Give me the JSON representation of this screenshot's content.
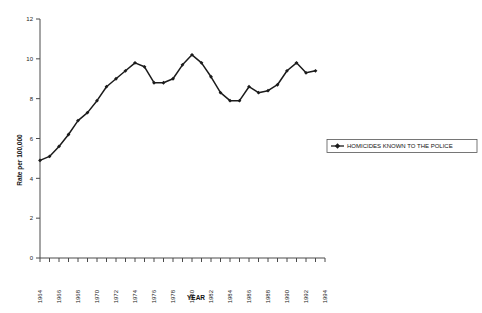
{
  "chart_data": {
    "type": "line",
    "title": "",
    "xlabel": "YEAR",
    "ylabel": "Rate per 100,000",
    "ylim": [
      0,
      12
    ],
    "xlim": [
      1964,
      1994
    ],
    "ytick_labels": [
      "0",
      "2",
      "4",
      "6",
      "8",
      "10",
      "12"
    ],
    "ytick_values": [
      0,
      2,
      4,
      6,
      8,
      10,
      12
    ],
    "xtick_labels": [
      "1964",
      "1966",
      "1968",
      "1970",
      "1972",
      "1974",
      "1976",
      "1978",
      "1980",
      "1982",
      "1984",
      "1986",
      "1988",
      "1990",
      "1992",
      "1994"
    ],
    "xtick_values": [
      1964,
      1966,
      1968,
      1970,
      1972,
      1974,
      1976,
      1978,
      1980,
      1982,
      1984,
      1986,
      1988,
      1990,
      1992,
      1994
    ],
    "minor_tick_interval": 1,
    "grid": false,
    "legend_position": "right",
    "marker": "filled-diamond",
    "line_color": "#1b1b1b",
    "x": [
      1964,
      1965,
      1966,
      1967,
      1968,
      1969,
      1970,
      1971,
      1972,
      1973,
      1974,
      1975,
      1976,
      1977,
      1978,
      1979,
      1980,
      1981,
      1982,
      1983,
      1984,
      1985,
      1986,
      1987,
      1988,
      1989,
      1990,
      1991,
      1992,
      1993
    ],
    "series": [
      {
        "name": "HOMICIDES KNOWN TO THE POLICE",
        "values": [
          4.9,
          5.1,
          5.6,
          6.2,
          6.9,
          7.3,
          7.9,
          8.6,
          9.0,
          9.4,
          9.8,
          9.6,
          8.8,
          8.8,
          9.0,
          9.7,
          10.2,
          9.8,
          9.1,
          8.3,
          7.9,
          7.9,
          8.6,
          8.3,
          8.4,
          8.7,
          9.4,
          9.8,
          9.3,
          9.4
        ]
      }
    ]
  },
  "legend": {
    "entries": [
      {
        "label": "HOMICIDES KNOWN TO THE POLICE",
        "marker": "line-marker-icon"
      }
    ]
  }
}
